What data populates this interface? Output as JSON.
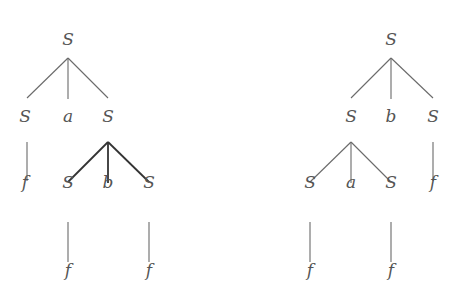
{
  "diagram": {
    "type": "parse-trees",
    "trees": [
      {
        "id": "left",
        "nodes": [
          {
            "id": "L0",
            "label": "S",
            "x": 68,
            "y": 45
          },
          {
            "id": "L1",
            "label": "S",
            "x": 25,
            "y": 122
          },
          {
            "id": "L2",
            "label": "a",
            "x": 68,
            "y": 122
          },
          {
            "id": "L3",
            "label": "S",
            "x": 108,
            "y": 122
          },
          {
            "id": "L4",
            "label": "f",
            "x": 25,
            "y": 188
          },
          {
            "id": "L5",
            "label": "S",
            "x": 68,
            "y": 188
          },
          {
            "id": "L6",
            "label": "b",
            "x": 108,
            "y": 188
          },
          {
            "id": "L7",
            "label": "S",
            "x": 149,
            "y": 188
          },
          {
            "id": "L8",
            "label": "f",
            "x": 68,
            "y": 276
          },
          {
            "id": "L9",
            "label": "f",
            "x": 149,
            "y": 276
          }
        ],
        "edges": [
          {
            "from": "L0",
            "to": "L1",
            "x1": 68,
            "y1": 58,
            "x2": 27,
            "y2": 98
          },
          {
            "from": "L0",
            "to": "L2",
            "x1": 68,
            "y1": 58,
            "x2": 68,
            "y2": 99
          },
          {
            "from": "L0",
            "to": "L3",
            "x1": 68,
            "y1": 58,
            "x2": 108,
            "y2": 98
          },
          {
            "from": "L1",
            "to": "L4",
            "x1": 27,
            "y1": 142,
            "x2": 27,
            "y2": 181
          },
          {
            "from": "L3",
            "to": "L5",
            "x1": 108,
            "y1": 142,
            "x2": 68,
            "y2": 182,
            "bold": true
          },
          {
            "from": "L3",
            "to": "L6",
            "x1": 108,
            "y1": 142,
            "x2": 108,
            "y2": 183,
            "bold": true
          },
          {
            "from": "L3",
            "to": "L7",
            "x1": 108,
            "y1": 142,
            "x2": 149,
            "y2": 182,
            "bold": true
          },
          {
            "from": "L5",
            "to": "L8",
            "x1": 68,
            "y1": 222,
            "x2": 68,
            "y2": 262
          },
          {
            "from": "L7",
            "to": "L9",
            "x1": 149,
            "y1": 222,
            "x2": 149,
            "y2": 262
          }
        ]
      },
      {
        "id": "right",
        "nodes": [
          {
            "id": "R0",
            "label": "S",
            "x": 391,
            "y": 45
          },
          {
            "id": "R1",
            "label": "S",
            "x": 351,
            "y": 122
          },
          {
            "id": "R2",
            "label": "b",
            "x": 391,
            "y": 122
          },
          {
            "id": "R3",
            "label": "S",
            "x": 433,
            "y": 122
          },
          {
            "id": "R4",
            "label": "S",
            "x": 310,
            "y": 188
          },
          {
            "id": "R5",
            "label": "a",
            "x": 351,
            "y": 188
          },
          {
            "id": "R6",
            "label": "S",
            "x": 391,
            "y": 188
          },
          {
            "id": "R7",
            "label": "f",
            "x": 433,
            "y": 188
          },
          {
            "id": "R8",
            "label": "f",
            "x": 310,
            "y": 276
          },
          {
            "id": "R9",
            "label": "f",
            "x": 391,
            "y": 276
          }
        ],
        "edges": [
          {
            "from": "R0",
            "to": "R1",
            "x1": 391,
            "y1": 58,
            "x2": 351,
            "y2": 98
          },
          {
            "from": "R0",
            "to": "R2",
            "x1": 391,
            "y1": 58,
            "x2": 391,
            "y2": 99
          },
          {
            "from": "R0",
            "to": "R3",
            "x1": 391,
            "y1": 58,
            "x2": 433,
            "y2": 98
          },
          {
            "from": "R1",
            "to": "R4",
            "x1": 351,
            "y1": 142,
            "x2": 310,
            "y2": 182
          },
          {
            "from": "R1",
            "to": "R5",
            "x1": 351,
            "y1": 142,
            "x2": 351,
            "y2": 183
          },
          {
            "from": "R1",
            "to": "R6",
            "x1": 351,
            "y1": 142,
            "x2": 391,
            "y2": 182
          },
          {
            "from": "R3",
            "to": "R7",
            "x1": 433,
            "y1": 142,
            "x2": 433,
            "y2": 181
          },
          {
            "from": "R4",
            "to": "R8",
            "x1": 310,
            "y1": 222,
            "x2": 310,
            "y2": 262
          },
          {
            "from": "R6",
            "to": "R9",
            "x1": 391,
            "y1": 222,
            "x2": 391,
            "y2": 262
          }
        ]
      }
    ]
  }
}
